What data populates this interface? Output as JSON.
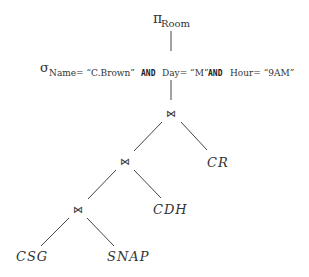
{
  "diagram": {
    "type": "relational-algebra-expression-tree",
    "projection": {
      "symbol": "π",
      "subscript": "Room"
    },
    "selection": {
      "symbol": "σ",
      "cond1": "Name= “C.Brown”",
      "and1": "AND",
      "cond2": "Day= “M”",
      "and2": "AND",
      "cond3": "Hour= “9AM”"
    },
    "joins": {
      "top": "⋈",
      "middle": "⋈",
      "bottom": "⋈"
    },
    "relations": {
      "cr": "CR",
      "cdh": "CDH",
      "csg": "CSG",
      "snap": "SNAP"
    }
  }
}
